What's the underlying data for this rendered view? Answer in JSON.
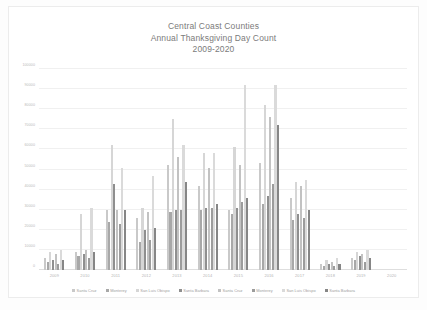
{
  "chart_data": {
    "type": "bar",
    "title": "Central Coast Counties Annual Thanksgiving Day Count 2009-2020",
    "title_lines": [
      "Central Coast Counties",
      "Annual Thanksgiving Day Count",
      "2009-2020"
    ],
    "xlabel": "",
    "ylabel": "",
    "ylim": [
      0,
      100000
    ],
    "grid": true,
    "legend_position": "bottom",
    "yticks": [
      0,
      10000,
      20000,
      30000,
      40000,
      50000,
      60000,
      70000,
      80000,
      90000,
      100000
    ],
    "ytick_labels": [
      "0",
      "10000",
      "20000",
      "30000",
      "40000",
      "50000",
      "60000",
      "70000",
      "80000",
      "90000",
      "100000"
    ],
    "categories": [
      "2009",
      "2010",
      "2011",
      "2012",
      "2013",
      "2014",
      "2015",
      "2016",
      "2017",
      "2018",
      "2019",
      "2020"
    ],
    "series": [
      {
        "name": "Santa Cruz",
        "color": "#c9c9c9",
        "values": [
          6000,
          9000,
          30000,
          26000,
          52000,
          42000,
          30000,
          53000,
          36000,
          3000,
          6000,
          0
        ]
      },
      {
        "name": "Monterey",
        "color": "#a8a8a8",
        "values": [
          4000,
          7000,
          24000,
          14000,
          29000,
          30000,
          28000,
          33000,
          25000,
          2000,
          5000,
          0
        ]
      },
      {
        "name": "San Luis Obispo",
        "color": "#d6d6d6",
        "values": [
          9000,
          28000,
          62000,
          31000,
          75000,
          58000,
          61000,
          82000,
          44000,
          5000,
          9000,
          0
        ]
      },
      {
        "name": "Santa Barbara",
        "color": "#8f8f8f",
        "values": [
          5000,
          8000,
          43000,
          20000,
          30000,
          31000,
          31000,
          37000,
          28000,
          3000,
          7000,
          0
        ]
      },
      {
        "name": "Santa Cruz",
        "color": "#c2c2c2",
        "values": [
          8000,
          10000,
          30000,
          29000,
          56000,
          51000,
          52000,
          76000,
          42000,
          4000,
          8000,
          0
        ]
      },
      {
        "name": "Monterey",
        "color": "#9c9c9c",
        "values": [
          3000,
          6000,
          23000,
          15000,
          30000,
          31000,
          34000,
          43000,
          26000,
          2000,
          4000,
          0
        ]
      },
      {
        "name": "San Luis Obispo",
        "color": "#dadada",
        "values": [
          10000,
          31000,
          51000,
          47000,
          62000,
          58000,
          92000,
          92000,
          45000,
          6000,
          10000,
          0
        ]
      },
      {
        "name": "Santa Barbara",
        "color": "#868686",
        "values": [
          5000,
          9000,
          30000,
          21000,
          44000,
          33000,
          36000,
          72000,
          30000,
          3000,
          6000,
          0
        ]
      }
    ]
  }
}
